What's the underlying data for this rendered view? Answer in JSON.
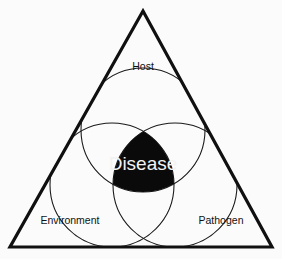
{
  "figure": {
    "name": "epidemiologic-triangle",
    "background_color": "#fbfbfb",
    "stroke_color": "#101010",
    "core_fill_color": "#0a0a0a",
    "core_text_color": "#f2f2f2"
  },
  "triangle": {
    "apex": {
      "x": 143,
      "y": 11
    },
    "bottom_left": {
      "x": 10,
      "y": 247
    },
    "bottom_right": {
      "x": 272,
      "y": 247
    },
    "stroke_width": 3.2
  },
  "circles": [
    {
      "id": "host",
      "cx": 143,
      "cy": 130,
      "r": 62
    },
    {
      "id": "environment",
      "cx": 112,
      "cy": 185,
      "r": 62
    },
    {
      "id": "pathogen",
      "cx": 175,
      "cy": 185,
      "r": 62
    }
  ],
  "labels": {
    "host": "Host",
    "environment": "Environment",
    "pathogen": "Pathogen",
    "core": "Disease"
  },
  "label_positions": {
    "host": {
      "x": 143,
      "y": 67,
      "anchor": "middle"
    },
    "environment": {
      "x": 70,
      "y": 221,
      "anchor": "middle"
    },
    "pathogen": {
      "x": 221,
      "y": 221,
      "anchor": "middle"
    },
    "core": {
      "x": 143,
      "y": 165
    }
  },
  "core_region": {
    "top_vertex": {
      "x": 143,
      "y": 122
    },
    "left_vertex": {
      "x": 100,
      "y": 192
    },
    "right_vertex": {
      "x": 187,
      "y": 192
    }
  }
}
